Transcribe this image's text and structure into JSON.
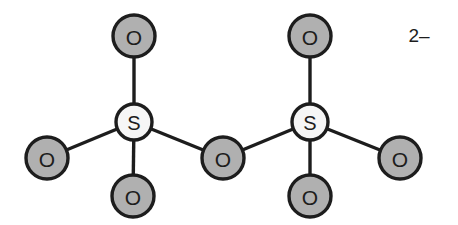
{
  "figure": {
    "background_color": "#ffffff",
    "line_color": "#1d1d1d",
    "oxygen_fill": "#b0b0b0",
    "sulfur_fill": "#f6f6f6",
    "charge": "2–"
  },
  "chart_data": {
    "type": "diagram",
    "xlabel": "",
    "ylabel": "",
    "atoms": [
      {
        "id": "O1",
        "label": "O",
        "element": "O",
        "x": 134,
        "y": 36,
        "r": 21,
        "fill": "#b0b0b0",
        "role": "terminal-oxygen"
      },
      {
        "id": "S1",
        "label": "S",
        "element": "S",
        "x": 134,
        "y": 122,
        "r": 18,
        "fill": "#f6f6f6",
        "role": "sulfur"
      },
      {
        "id": "O2",
        "label": "O",
        "element": "O",
        "x": 47,
        "y": 158,
        "r": 21,
        "fill": "#b0b0b0",
        "role": "terminal-oxygen"
      },
      {
        "id": "O3",
        "label": "O",
        "element": "O",
        "x": 133,
        "y": 196,
        "r": 21,
        "fill": "#b0b0b0",
        "role": "terminal-oxygen"
      },
      {
        "id": "O4",
        "label": "O",
        "element": "O",
        "x": 223,
        "y": 158,
        "r": 21,
        "fill": "#b0b0b0",
        "role": "bridging-oxygen"
      },
      {
        "id": "S2",
        "label": "S",
        "element": "S",
        "x": 310,
        "y": 122,
        "r": 18,
        "fill": "#f6f6f6",
        "role": "sulfur"
      },
      {
        "id": "O5",
        "label": "O",
        "element": "O",
        "x": 310,
        "y": 36,
        "r": 21,
        "fill": "#b0b0b0",
        "role": "terminal-oxygen"
      },
      {
        "id": "O6",
        "label": "O",
        "element": "O",
        "x": 310,
        "y": 196,
        "r": 21,
        "fill": "#b0b0b0",
        "role": "terminal-oxygen"
      },
      {
        "id": "O7",
        "label": "O",
        "element": "O",
        "x": 400,
        "y": 158,
        "r": 21,
        "fill": "#b0b0b0",
        "role": "terminal-oxygen"
      }
    ],
    "bonds": [
      {
        "from": "S1",
        "to": "O1",
        "x1": 134,
        "y1": 122,
        "x2": 134,
        "y2": 36
      },
      {
        "from": "S1",
        "to": "O2",
        "x1": 134,
        "y1": 122,
        "x2": 47,
        "y2": 158
      },
      {
        "from": "S1",
        "to": "O3",
        "x1": 134,
        "y1": 122,
        "x2": 133,
        "y2": 196
      },
      {
        "from": "S1",
        "to": "O4",
        "x1": 134,
        "y1": 122,
        "x2": 223,
        "y2": 158
      },
      {
        "from": "S2",
        "to": "O4",
        "x1": 310,
        "y1": 122,
        "x2": 223,
        "y2": 158
      },
      {
        "from": "S2",
        "to": "O5",
        "x1": 310,
        "y1": 122,
        "x2": 310,
        "y2": 36
      },
      {
        "from": "S2",
        "to": "O6",
        "x1": 310,
        "y1": 122,
        "x2": 310,
        "y2": 196
      },
      {
        "from": "S2",
        "to": "O7",
        "x1": 310,
        "y1": 122,
        "x2": 400,
        "y2": 158
      }
    ],
    "annotations": [
      {
        "id": "charge",
        "text": "2–",
        "x": 419,
        "y": 35
      }
    ]
  }
}
